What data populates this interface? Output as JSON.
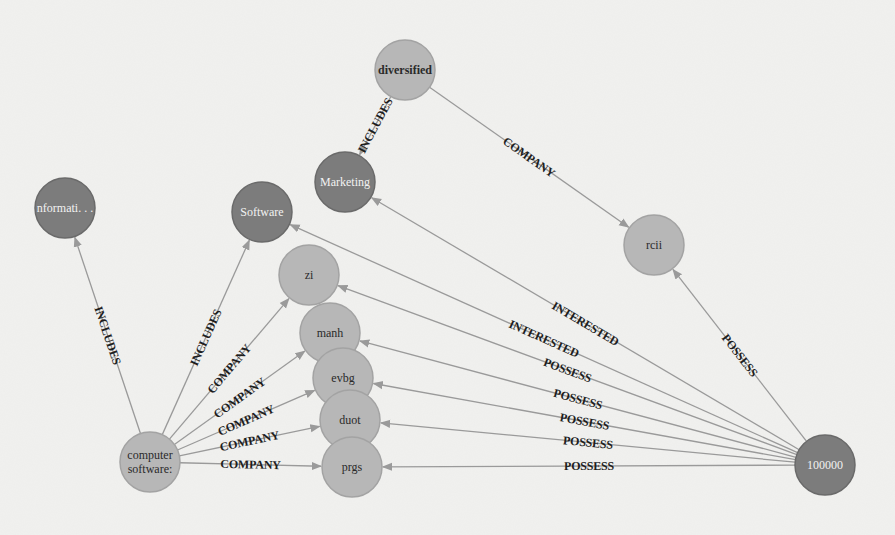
{
  "graph": {
    "type": "knowledge-graph",
    "colors": {
      "background": "#f1f1ef",
      "node_dark": "#7c7c7c",
      "node_light": "#b7b7b7",
      "edge": "#9a9a9a",
      "edge_label": "#1e1e1e"
    },
    "nodes": [
      {
        "id": "diversified",
        "label": "diversified",
        "x": 405,
        "y": 70,
        "style": "light",
        "bold": true
      },
      {
        "id": "marketing",
        "label": "Marketing",
        "x": 345,
        "y": 182,
        "style": "dark"
      },
      {
        "id": "informati",
        "label": "nformati. . .",
        "x": 65,
        "y": 208,
        "style": "dark"
      },
      {
        "id": "software",
        "label": "Software",
        "x": 262,
        "y": 212,
        "style": "dark"
      },
      {
        "id": "zi",
        "label": "zi",
        "x": 309,
        "y": 275,
        "style": "light"
      },
      {
        "id": "manh",
        "label": "manh",
        "x": 330,
        "y": 333,
        "style": "light"
      },
      {
        "id": "evbg",
        "label": "evbg",
        "x": 343,
        "y": 378,
        "style": "light"
      },
      {
        "id": "duot",
        "label": "duot",
        "x": 350,
        "y": 420,
        "style": "light"
      },
      {
        "id": "prgs",
        "label": "prgs",
        "x": 352,
        "y": 467,
        "style": "light"
      },
      {
        "id": "rcii",
        "label": "rcii",
        "x": 654,
        "y": 245,
        "style": "light"
      },
      {
        "id": "computer_software",
        "label": "computer",
        "label2": "software:",
        "x": 150,
        "y": 462,
        "style": "light"
      },
      {
        "id": "n100000",
        "label": "100000",
        "x": 825,
        "y": 465,
        "style": "dark"
      }
    ],
    "edges": [
      {
        "from": "diversified",
        "to": "marketing",
        "label": "INCLUDES"
      },
      {
        "from": "diversified",
        "to": "rcii",
        "label": "COMPANY"
      },
      {
        "from": "computer_software",
        "to": "informati",
        "label": "INCLUDES"
      },
      {
        "from": "computer_software",
        "to": "software",
        "label": "INCLUDES"
      },
      {
        "from": "computer_software",
        "to": "zi",
        "label": "COMPANY"
      },
      {
        "from": "computer_software",
        "to": "manh",
        "label": "COMPANY"
      },
      {
        "from": "computer_software",
        "to": "evbg",
        "label": "COMPANY"
      },
      {
        "from": "computer_software",
        "to": "duot",
        "label": "COMPANY"
      },
      {
        "from": "computer_software",
        "to": "prgs",
        "label": "COMPANY"
      },
      {
        "from": "n100000",
        "to": "marketing",
        "label": "INTERESTED"
      },
      {
        "from": "n100000",
        "to": "software",
        "label": "INTERESTED"
      },
      {
        "from": "n100000",
        "to": "zi",
        "label": "POSSESS"
      },
      {
        "from": "n100000",
        "to": "manh",
        "label": "POSSESS"
      },
      {
        "from": "n100000",
        "to": "evbg",
        "label": "POSSESS"
      },
      {
        "from": "n100000",
        "to": "duot",
        "label": "POSSESS"
      },
      {
        "from": "n100000",
        "to": "prgs",
        "label": "POSSESS"
      },
      {
        "from": "n100000",
        "to": "rcii",
        "label": "POSSESS"
      }
    ]
  }
}
